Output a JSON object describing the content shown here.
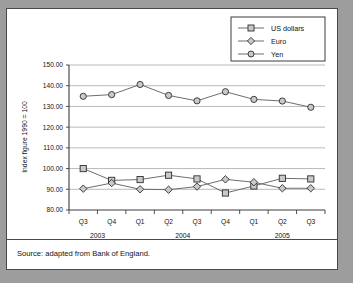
{
  "figure": {
    "source_note": "Source: adapted from Bank of England."
  },
  "chart_data": {
    "type": "line",
    "title": "",
    "xlabel": "",
    "ylabel": "Index figure 1990 = 100",
    "ylim": [
      80,
      150
    ],
    "ytick_step": 10,
    "ytick_labels": [
      "80.00",
      "90.00",
      "100.00",
      "110.00",
      "120.00",
      "130.00",
      "140.00",
      "150.00"
    ],
    "ytick_values": [
      80,
      90,
      100,
      110,
      120,
      130,
      140,
      150
    ],
    "grid": "horizontal",
    "legend_position": "top-right",
    "categories": [
      "Q3",
      "Q4",
      "Q1",
      "Q2",
      "Q3",
      "Q4",
      "Q1",
      "Q2",
      "Q3"
    ],
    "group_labels": [
      {
        "label": "2003",
        "start_index": 0,
        "end_index": 1
      },
      {
        "label": "2004",
        "start_index": 2,
        "end_index": 5
      },
      {
        "label": "2005",
        "start_index": 6,
        "end_index": 8
      }
    ],
    "series": [
      {
        "name": "US dollars",
        "marker": "square",
        "values": [
          100.0,
          94.3,
          94.7,
          96.8,
          95.0,
          88.2,
          91.6,
          95.3,
          95.0
        ]
      },
      {
        "name": "Euro",
        "marker": "diamond",
        "values": [
          90.3,
          93.0,
          90.0,
          89.8,
          91.3,
          94.8,
          93.4,
          90.5,
          90.5
        ]
      },
      {
        "name": "Yen",
        "marker": "circle",
        "values": [
          134.9,
          135.7,
          140.6,
          135.3,
          132.7,
          137.1,
          133.4,
          132.6,
          129.6
        ]
      }
    ],
    "colors": {
      "line": "#6e6e6e",
      "marker_fill": "#c9c9c9",
      "marker_stroke": "#2d2d2d",
      "grid": "#9a9a9a",
      "axis": "#3c3c3c",
      "panel_background": "#ffffff",
      "page_background": "#9d9d9d"
    }
  }
}
